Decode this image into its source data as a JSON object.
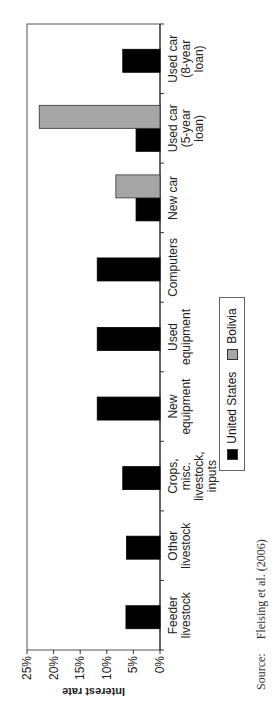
{
  "chart_data": {
    "type": "bar",
    "orientation": "vertical (figure rotated 90° counter-clockwise on page)",
    "title": "",
    "xlabel": "",
    "ylabel": "Interest rate",
    "ylim": [
      0,
      25
    ],
    "yticks": [
      "0%",
      "5%",
      "10%",
      "15%",
      "20%",
      "25%"
    ],
    "grid": false,
    "legend_position": "bottom",
    "categories": [
      "Feeder livestock",
      "Other livestock",
      "Crops, misc. livestock, inputs",
      "New equipment",
      "Used equipment",
      "Computers",
      "New car",
      "Used car (5-year loan)",
      "Used car (8-year loan)"
    ],
    "category_label_lines": [
      [
        "Feeder",
        "livestock"
      ],
      [
        "Other",
        "livestock"
      ],
      [
        "Crops,",
        "misc.",
        "livestock,",
        "inputs"
      ],
      [
        "New",
        "equipment"
      ],
      [
        "Used",
        "equipment"
      ],
      [
        "Computers"
      ],
      [
        "New car"
      ],
      [
        "Used car",
        "(5-year",
        "loan)"
      ],
      [
        "Used car",
        "(8-year",
        "loan)"
      ]
    ],
    "series": [
      {
        "name": "United States",
        "color": "#000000",
        "values": [
          6.4,
          6.3,
          7.0,
          11.8,
          11.8,
          11.8,
          4.5,
          4.5,
          7.0
        ]
      },
      {
        "name": "Bolivia",
        "color": "#a6a6a6",
        "values": [
          null,
          null,
          null,
          null,
          null,
          null,
          8.3,
          22.7,
          null
        ]
      }
    ],
    "source": "Fleising et al. (2006)"
  },
  "axis": {
    "title": "Interest rate",
    "ticks": [
      "0%",
      "5%",
      "10%",
      "15%",
      "20%",
      "25%"
    ]
  },
  "legend": {
    "items": [
      {
        "label": "United States",
        "color": "#000000"
      },
      {
        "label": "Bolivia",
        "color": "#a6a6a6"
      }
    ]
  },
  "source": {
    "label": "Source:",
    "text": "Fleising et al. (2006)"
  }
}
